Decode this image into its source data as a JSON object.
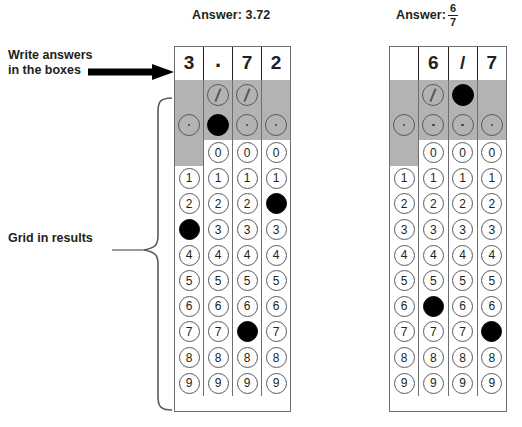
{
  "annotations": {
    "write_answers": "Write answers\nin the boxes",
    "grid_in_results": "Grid in results",
    "arrow_icon": "right-arrow-icon",
    "brace_icon": "curly-brace-icon"
  },
  "grids": [
    {
      "id": "grid-decimal",
      "answer_prefix": "Answer: 3.72",
      "answer_value": "3.72",
      "written_row": [
        "3",
        ".",
        "7",
        "2"
      ],
      "columns": [
        {
          "index": 1,
          "written": "3",
          "slash_cell": "shaded-empty",
          "dot_cell": "open",
          "zero_cell": "shaded-empty",
          "filled_digit": "3"
        },
        {
          "index": 2,
          "written": ".",
          "slash_cell": "open",
          "dot_cell": "filled",
          "zero_cell": "open",
          "filled_digit": null
        },
        {
          "index": 3,
          "written": "7",
          "slash_cell": "open",
          "dot_cell": "open",
          "zero_cell": "open",
          "filled_digit": "7"
        },
        {
          "index": 4,
          "written": "2",
          "slash_cell": "shaded-empty",
          "dot_cell": "open",
          "zero_cell": "open",
          "filled_digit": "2"
        }
      ]
    },
    {
      "id": "grid-fraction",
      "answer_prefix": "Answer:",
      "answer_numerator": "6",
      "answer_denominator": "7",
      "written_row": [
        "",
        "6",
        "/",
        "7"
      ],
      "columns": [
        {
          "index": 1,
          "written": "",
          "slash_cell": "shaded-empty",
          "dot_cell": "open",
          "zero_cell": "shaded-empty",
          "filled_digit": null
        },
        {
          "index": 2,
          "written": "6",
          "slash_cell": "open",
          "dot_cell": "open",
          "zero_cell": "open",
          "filled_digit": "6"
        },
        {
          "index": 3,
          "written": "/",
          "slash_cell": "filled",
          "dot_cell": "open",
          "zero_cell": "open",
          "filled_digit": null
        },
        {
          "index": 4,
          "written": "7",
          "slash_cell": "shaded-empty",
          "dot_cell": "open",
          "zero_cell": "open",
          "filled_digit": "7"
        }
      ]
    }
  ],
  "digit_rows": [
    "0",
    "1",
    "2",
    "3",
    "4",
    "5",
    "6",
    "7",
    "8",
    "9"
  ],
  "colors": {
    "shade": "#b3b3b3",
    "bubble_stroke": "#58595b",
    "fill": "#000000",
    "text": "#231f20",
    "grid_border": "#6d6e71",
    "background": "#ffffff"
  }
}
